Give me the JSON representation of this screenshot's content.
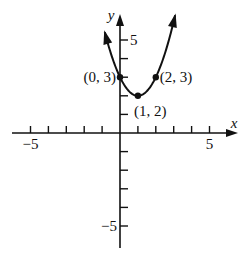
{
  "chart_data": {
    "type": "line",
    "title": "",
    "function": "y = (x - 1)^2 + 2",
    "xlabel": "x",
    "ylabel": "y",
    "xlim": [
      -5.5,
      6.5
    ],
    "ylim": [
      -6,
      6.3
    ],
    "grid": false,
    "x_ticks": [
      -5,
      -4,
      -3,
      -2,
      -1,
      1,
      2,
      3,
      4,
      5
    ],
    "y_ticks": [
      -5,
      -4,
      -3,
      -2,
      -1,
      1,
      2,
      3,
      4,
      5
    ],
    "x_tick_labels": [
      {
        "value": -5,
        "label": "−5"
      },
      {
        "value": 5,
        "label": "5"
      }
    ],
    "y_tick_labels": [
      {
        "value": 5,
        "label": "5"
      },
      {
        "value": -5,
        "label": "−5"
      }
    ],
    "series": [
      {
        "name": "parabola",
        "x": [
          -0.85,
          -0.5,
          0,
          0.5,
          1,
          1.5,
          2,
          2.5,
          3.08
        ],
        "values": [
          5.42,
          4.25,
          3,
          2.25,
          2,
          2.25,
          3,
          4.25,
          6.33
        ],
        "arrows_both_ends": true
      }
    ],
    "annotations": [
      {
        "x": 0,
        "y": 3,
        "label": "(0, 3)",
        "position": "left"
      },
      {
        "x": 1,
        "y": 2,
        "label": "(1, 2)",
        "position": "below-right"
      },
      {
        "x": 2,
        "y": 3,
        "label": "(2, 3)",
        "position": "right"
      }
    ]
  }
}
